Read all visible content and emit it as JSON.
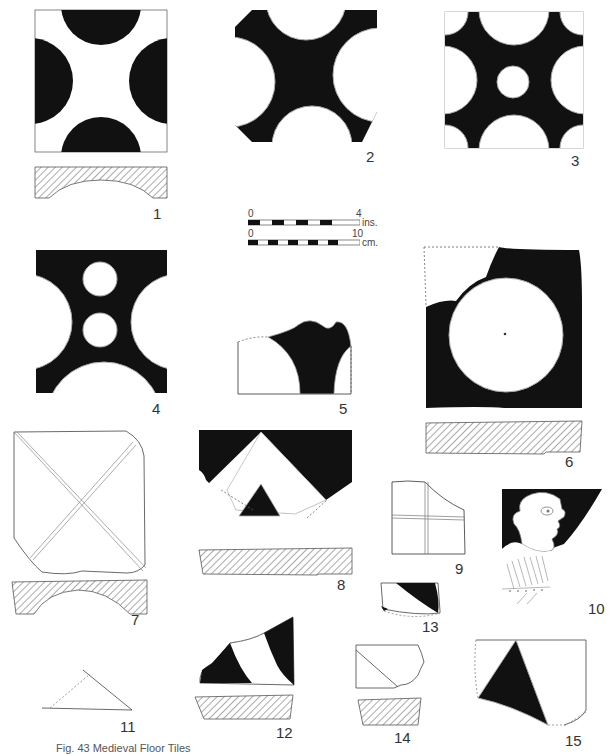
{
  "figure": {
    "caption": "Fig. 43 Medieval Floor Tiles",
    "caption_clipped": true,
    "ink_color": "#111111",
    "paper_color": "#ffffff",
    "hatch_color": "#555555"
  },
  "scale_bar": {
    "inches": {
      "start": "0",
      "end": "4",
      "unit": "ins."
    },
    "centimetres": {
      "start": "0",
      "end": "10",
      "unit": "cm."
    }
  },
  "tiles": [
    {
      "number": "1",
      "pattern": "four dark half-circles on light ground",
      "has_section": true
    },
    {
      "number": "2",
      "pattern": "four light half-circles on dark ground, clipped corners",
      "has_section": false
    },
    {
      "number": "3",
      "pattern": "light circles and quarter-circles with central small circle on dark ground",
      "has_section": false
    },
    {
      "number": "4",
      "pattern": "light half-circles with two small central circles on dark ground",
      "has_section": false
    },
    {
      "number": "5",
      "pattern": "fragment, dark band between light arcs",
      "has_section": false
    },
    {
      "number": "6",
      "pattern": "large light circle on dark ground",
      "has_section": true
    },
    {
      "number": "7",
      "pattern": "incised diagonal cross (plain tile)",
      "has_section": true
    },
    {
      "number": "8",
      "pattern": "light chevron with dark triangle on dark ground",
      "has_section": true
    },
    {
      "number": "9",
      "pattern": "incised cross, fragment",
      "has_section": false
    },
    {
      "number": "10",
      "pattern": "human head in profile with ruff, light on dark ground",
      "has_section": false
    },
    {
      "number": "11",
      "pattern": "triangular outline fragment",
      "has_section": false
    },
    {
      "number": "12",
      "pattern": "dark and light diagonal bands, fragment",
      "has_section": true
    },
    {
      "number": "13",
      "pattern": "small fragment with dark curved segment",
      "has_section": false
    },
    {
      "number": "14",
      "pattern": "incised diagonal line, fragment",
      "has_section": true
    },
    {
      "number": "15",
      "pattern": "dark triangle on light ground, fragment",
      "has_section": false
    }
  ]
}
